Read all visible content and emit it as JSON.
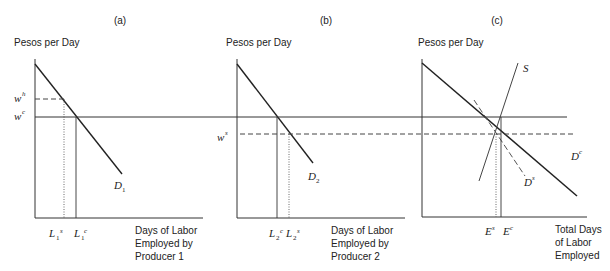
{
  "panels": [
    {
      "id": "a",
      "title": "(a)",
      "y_axis_label": "Pesos per Day",
      "x_axis_label": [
        "Days of Labor",
        "Employed by",
        "Producer 1"
      ],
      "curve_label": {
        "base": "D",
        "sub": "1"
      },
      "y_ticks": [
        {
          "base": "w",
          "sup": "h"
        },
        {
          "base": "w",
          "sup": "c"
        }
      ],
      "x_ticks": [
        {
          "base": "L",
          "sub": "1",
          "sup": "s"
        },
        {
          "base": "L",
          "sub": "1",
          "sup": "c"
        }
      ]
    },
    {
      "id": "b",
      "title": "(b)",
      "y_axis_label": "Pesos per Day",
      "x_axis_label": [
        "Days of Labor",
        "Employed by",
        "Producer 2"
      ],
      "curve_label": {
        "base": "D",
        "sub": "2"
      },
      "y_ticks": [
        {
          "base": "w",
          "sup": "s"
        }
      ],
      "x_ticks": [
        {
          "base": "L",
          "sub": "2",
          "sup": "c"
        },
        {
          "base": "L",
          "sub": "2",
          "sup": "s"
        }
      ]
    },
    {
      "id": "c",
      "title": "(c)",
      "y_axis_label": "Pesos per Day",
      "x_axis_label": [
        "Total Days",
        "of Labor",
        "Employed"
      ],
      "curve_labels": [
        {
          "base": "S",
          "sup": ""
        },
        {
          "base": "D",
          "sup": "c"
        },
        {
          "base": "D",
          "sup": "s"
        }
      ],
      "x_ticks": [
        {
          "base": "E",
          "sup": "s"
        },
        {
          "base": "E",
          "sup": "c"
        }
      ]
    }
  ]
}
